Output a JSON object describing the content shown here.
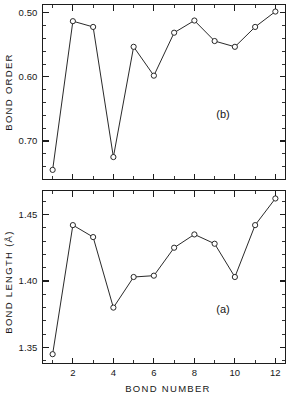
{
  "figure": {
    "background": "#ffffff",
    "ink_color": "#1d1d1d",
    "xlabel": "BOND  NUMBER"
  },
  "chart_data": [
    {
      "type": "line",
      "panel_tag": "(b)",
      "title": "",
      "xlabel": "BOND  NUMBER",
      "ylabel": "BOND  ORDER",
      "x": [
        1,
        2,
        3,
        4,
        5,
        6,
        7,
        8,
        9,
        10,
        11,
        12
      ],
      "values": [
        0.745,
        0.513,
        0.522,
        0.725,
        0.553,
        0.598,
        0.531,
        0.512,
        0.544,
        0.553,
        0.522,
        0.498
      ],
      "xlim": [
        0.5,
        12.5
      ],
      "ylim": [
        0.76,
        0.487
      ],
      "y_inverted": true,
      "ytick_values": [
        0.5,
        0.6,
        0.7
      ],
      "ytick_labels": [
        "0.50",
        "0.60",
        "0.70"
      ],
      "yminor_step": 0.02,
      "xtick_values": [
        2,
        4,
        6,
        8,
        10,
        12
      ],
      "xtick_labels": [
        "",
        "",
        "",
        "",
        "",
        ""
      ],
      "xminor_step": 1,
      "grid": false,
      "legend": "none",
      "marker": "open-circle"
    },
    {
      "type": "line",
      "panel_tag": "(a)",
      "title": "",
      "xlabel": "BOND  NUMBER",
      "ylabel": "BOND  LENGTH  (Å)",
      "x": [
        1,
        2,
        3,
        4,
        5,
        6,
        7,
        8,
        9,
        10,
        11,
        12
      ],
      "values": [
        1.345,
        1.442,
        1.433,
        1.38,
        1.403,
        1.404,
        1.425,
        1.435,
        1.428,
        1.403,
        1.442,
        1.462
      ],
      "xlim": [
        0.5,
        12.5
      ],
      "ylim": [
        1.338,
        1.468
      ],
      "y_inverted": false,
      "ytick_values": [
        1.35,
        1.4,
        1.45
      ],
      "ytick_labels": [
        "1.35",
        "1.40",
        "1.45"
      ],
      "yminor_step": 0.01,
      "xtick_values": [
        2,
        4,
        6,
        8,
        10,
        12
      ],
      "xtick_labels": [
        "2",
        "4",
        "6",
        "8",
        "10",
        "12"
      ],
      "xminor_step": 1,
      "grid": false,
      "legend": "none",
      "marker": "open-circle"
    }
  ]
}
